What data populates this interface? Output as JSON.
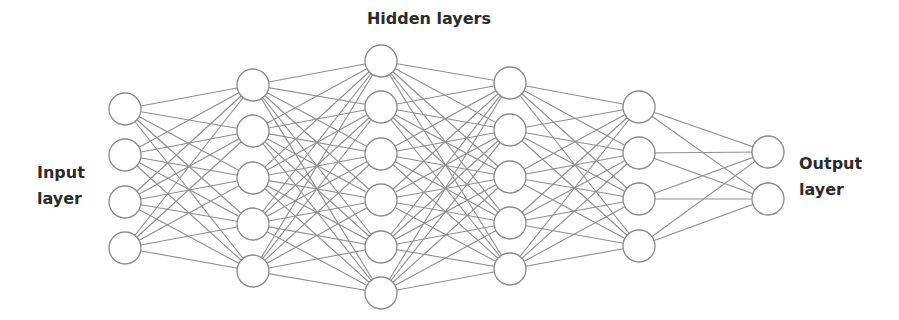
{
  "title": "Hidden layers",
  "input_label": [
    "Input",
    "layer"
  ],
  "output_label": [
    "Output",
    "layer"
  ],
  "style": {
    "edge_color": "#8f8f8f",
    "node_stroke": "#8a8a8a",
    "node_fill": "#ffffff",
    "text_color": "#2b2b2b",
    "node_radius": 16
  },
  "layers": [
    {
      "name": "input",
      "x": 125,
      "ys": [
        109,
        155,
        202,
        248
      ]
    },
    {
      "name": "hidden-1",
      "x": 253,
      "ys": [
        85,
        131,
        178,
        224,
        271
      ]
    },
    {
      "name": "hidden-2",
      "x": 381,
      "ys": [
        61,
        107,
        154,
        200,
        247,
        293
      ]
    },
    {
      "name": "hidden-3",
      "x": 510,
      "ys": [
        83,
        130,
        177,
        223,
        269
      ]
    },
    {
      "name": "hidden-4",
      "x": 639,
      "ys": [
        107,
        153,
        199,
        246
      ]
    },
    {
      "name": "output",
      "x": 768,
      "ys": [
        152,
        199
      ]
    }
  ]
}
